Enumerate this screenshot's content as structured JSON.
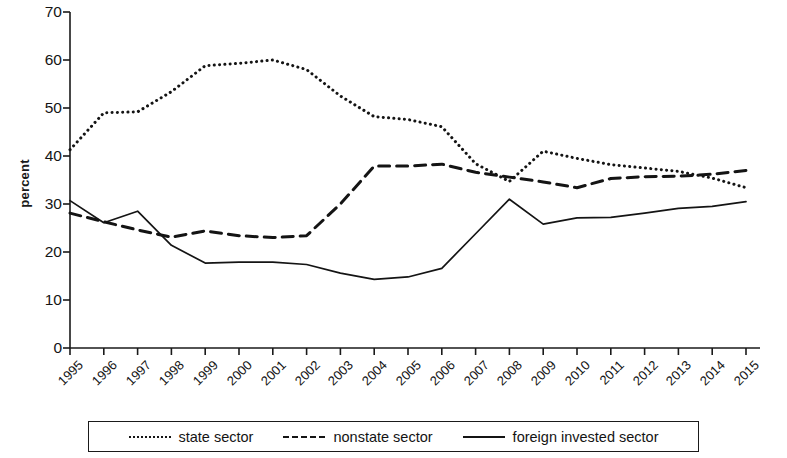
{
  "chart_data": {
    "type": "line",
    "title": "",
    "subtitle": "",
    "xlabel": "",
    "ylabel": "percent",
    "ylim": [
      0,
      70
    ],
    "ytick_step": 10,
    "yticks": [
      "0",
      "10",
      "20",
      "30",
      "40",
      "50",
      "60",
      "70"
    ],
    "grid": false,
    "legend_position": "bottom",
    "categories": [
      "1995",
      "1996",
      "1997",
      "1998",
      "1999",
      "2000",
      "2001",
      "2002",
      "2003",
      "2004",
      "2005",
      "2006",
      "2007",
      "2008",
      "2009",
      "2010",
      "2011",
      "2012",
      "2013",
      "2014",
      "2015"
    ],
    "series": [
      {
        "name": "state sector",
        "style": "dotted",
        "color": "#141414",
        "values": [
          41.3,
          49.0,
          49.2,
          53.4,
          58.8,
          59.3,
          60.0,
          58.0,
          52.5,
          48.2,
          47.6,
          46.1,
          38.4,
          34.7,
          41.0,
          39.5,
          38.2,
          37.5,
          36.8,
          35.4,
          33.4
        ]
      },
      {
        "name": "nonstate sector",
        "style": "dashed",
        "color": "#141414",
        "values": [
          28.1,
          26.3,
          24.6,
          23.1,
          24.4,
          23.4,
          23.0,
          23.4,
          30.0,
          37.9,
          37.9,
          38.3,
          36.6,
          35.6,
          34.6,
          33.4,
          35.3,
          35.7,
          35.8,
          36.2,
          37.0
        ]
      },
      {
        "name": "foreign invested sector",
        "style": "solid",
        "color": "#141414",
        "values": [
          30.7,
          26.1,
          28.5,
          21.4,
          17.7,
          17.9,
          17.9,
          17.4,
          15.6,
          14.3,
          14.8,
          16.6,
          23.8,
          31.0,
          25.8,
          27.1,
          27.2,
          28.1,
          29.1,
          29.5,
          30.5
        ]
      }
    ]
  },
  "legend": {
    "items": [
      {
        "label": "state sector",
        "style": "dotted"
      },
      {
        "label": "nonstate sector",
        "style": "dashed"
      },
      {
        "label": "foreign invested sector",
        "style": "solid"
      }
    ]
  },
  "axis": {
    "y_title": "percent"
  }
}
